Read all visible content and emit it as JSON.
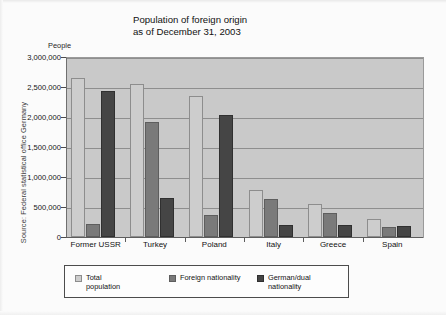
{
  "source_credit": "Source: Federal statistical office Germany",
  "chart_data": {
    "type": "bar",
    "title": "Population of foreign origin\nas of December 31, 2003",
    "xlabel": "",
    "ylabel": "People",
    "ylim": [
      0,
      3000000
    ],
    "grid": true,
    "legend_position": "bottom-left",
    "categories": [
      "Former USSR",
      "Turkey",
      "Poland",
      "Italy",
      "Greece",
      "Spain"
    ],
    "ytick_labels": [
      "3,000,000",
      "2,500,000",
      "2,000,000",
      "1,500,000",
      "1,000,000",
      "500,000",
      "0"
    ],
    "ytick_values": [
      3000000,
      2500000,
      2000000,
      1500000,
      1000000,
      500000,
      0
    ],
    "series": [
      {
        "name": "Total population",
        "color": "#cdcdcd",
        "values": [
          2650000,
          2550000,
          2350000,
          780000,
          550000,
          300000
        ]
      },
      {
        "name": "Foreign nationality",
        "color": "#7a7a7a",
        "values": [
          220000,
          1920000,
          360000,
          640000,
          400000,
          170000
        ]
      },
      {
        "name": "German/dual nationality",
        "color": "#454545",
        "values": [
          2440000,
          650000,
          2040000,
          200000,
          200000,
          180000
        ]
      }
    ],
    "legend": [
      {
        "label": "Total\npopulation",
        "color": "#cdcdcd"
      },
      {
        "label": "Foreign nationality",
        "color": "#7a7a7a"
      },
      {
        "label": "German/dual\nnationality",
        "color": "#454545"
      }
    ]
  }
}
